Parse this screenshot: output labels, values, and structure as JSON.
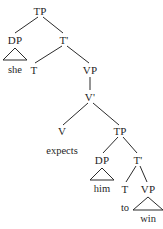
{
  "figure": {
    "kind": "syntax-tree",
    "sentence": "she expects him to win",
    "background_color": "#ffffff",
    "line_color": "#2b2b2b",
    "text_color": "#1f1f1f"
  },
  "chart_data": {
    "type": "diagram",
    "title": "",
    "nodes": [
      {
        "id": "TP1",
        "label": "TP",
        "x": 40,
        "y": 11,
        "kind": "category"
      },
      {
        "id": "DP1",
        "label": "DP",
        "x": 15,
        "y": 40,
        "kind": "category"
      },
      {
        "id": "she",
        "label": "she",
        "x": 15,
        "y": 70,
        "kind": "terminal"
      },
      {
        "id": "Tbar1",
        "label": "T'",
        "x": 64,
        "y": 40,
        "kind": "category"
      },
      {
        "id": "T1",
        "label": "T",
        "x": 34,
        "y": 70,
        "kind": "category"
      },
      {
        "id": "VP1",
        "label": "VP",
        "x": 90,
        "y": 70,
        "kind": "category"
      },
      {
        "id": "Vbar1",
        "label": "V'",
        "x": 90,
        "y": 97,
        "kind": "category"
      },
      {
        "id": "V1",
        "label": "V",
        "x": 62,
        "y": 131,
        "kind": "category"
      },
      {
        "id": "expects",
        "label": "expects",
        "x": 62,
        "y": 151,
        "kind": "terminal"
      },
      {
        "id": "TP2",
        "label": "TP",
        "x": 120,
        "y": 131,
        "kind": "category"
      },
      {
        "id": "DP2",
        "label": "DP",
        "x": 102,
        "y": 160,
        "kind": "category"
      },
      {
        "id": "him",
        "label": "him",
        "x": 102,
        "y": 189,
        "kind": "terminal"
      },
      {
        "id": "Tbar2",
        "label": "T'",
        "x": 138,
        "y": 160,
        "kind": "category"
      },
      {
        "id": "T2",
        "label": "T",
        "x": 125,
        "y": 189,
        "kind": "category"
      },
      {
        "id": "to",
        "label": "to",
        "x": 125,
        "y": 208,
        "kind": "terminal"
      },
      {
        "id": "VP2",
        "label": "VP",
        "x": 148,
        "y": 189,
        "kind": "category"
      },
      {
        "id": "win",
        "label": "win",
        "x": 148,
        "y": 219,
        "kind": "terminal"
      }
    ],
    "edges": [
      {
        "from": "TP1",
        "to": "DP1",
        "x1": 38,
        "y1": 17,
        "x2": 15,
        "y2": 33,
        "style": "line"
      },
      {
        "from": "TP1",
        "to": "Tbar1",
        "x1": 43,
        "y1": 17,
        "x2": 63,
        "y2": 33,
        "style": "line"
      },
      {
        "from": "Tbar1",
        "to": "T1",
        "x1": 62,
        "y1": 46,
        "x2": 35,
        "y2": 63,
        "style": "line"
      },
      {
        "from": "Tbar1",
        "to": "VP1",
        "x1": 67,
        "y1": 46,
        "x2": 89,
        "y2": 63,
        "style": "line"
      },
      {
        "from": "VP1",
        "to": "Vbar1",
        "x1": 90,
        "y1": 77,
        "x2": 90,
        "y2": 90,
        "style": "line"
      },
      {
        "from": "Vbar1",
        "to": "V1",
        "x1": 88,
        "y1": 103,
        "x2": 63,
        "y2": 125,
        "style": "line"
      },
      {
        "from": "Vbar1",
        "to": "TP2",
        "x1": 93,
        "y1": 103,
        "x2": 119,
        "y2": 125,
        "style": "line"
      },
      {
        "from": "TP2",
        "to": "DP2",
        "x1": 118,
        "y1": 137,
        "x2": 103,
        "y2": 153,
        "style": "line"
      },
      {
        "from": "TP2",
        "to": "Tbar2",
        "x1": 123,
        "y1": 137,
        "x2": 137,
        "y2": 153,
        "style": "line"
      },
      {
        "from": "Tbar2",
        "to": "T2",
        "x1": 136,
        "y1": 166,
        "x2": 126,
        "y2": 182,
        "style": "line"
      },
      {
        "from": "Tbar2",
        "to": "VP2",
        "x1": 140,
        "y1": 166,
        "x2": 147,
        "y2": 182,
        "style": "line"
      },
      {
        "from": "T2",
        "to": "to",
        "x1": 125,
        "y1": 195,
        "x2": 125,
        "y2": 201,
        "style": "none"
      }
    ],
    "triangles": [
      {
        "id": "tri-she",
        "over": "DP1",
        "word": "she",
        "cx": 15,
        "top": 48,
        "halfwidth": 12,
        "height": 12
      },
      {
        "id": "tri-him",
        "over": "DP2",
        "word": "him",
        "cx": 102,
        "top": 168,
        "halfwidth": 12,
        "height": 12
      },
      {
        "id": "tri-win",
        "over": "VP2",
        "word": "win",
        "cx": 148,
        "top": 197,
        "halfwidth": 15,
        "height": 13
      }
    ]
  }
}
